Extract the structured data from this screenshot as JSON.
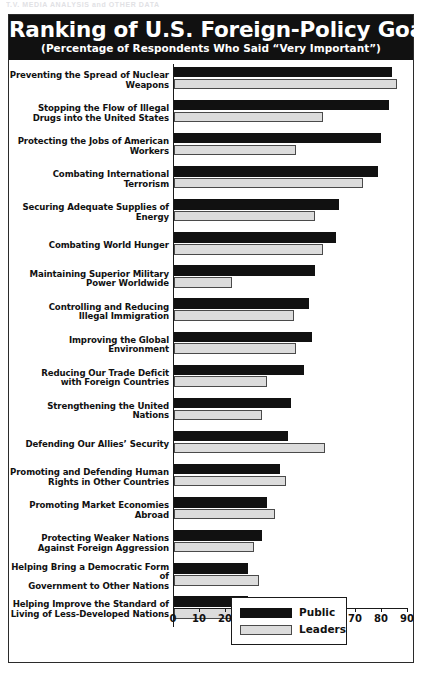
{
  "running_head": "T.V. MEDIA ANALYSIS and OTHER DATA",
  "chart_data": {
    "type": "bar",
    "orientation": "horizontal",
    "title": "Ranking of U.S. Foreign-Policy Goals",
    "subtitle": "(Percentage of Respondents Who Said “Very Important”)",
    "xlabel": "",
    "ylabel": "",
    "xlim": [
      0,
      90
    ],
    "grid": false,
    "legend_position": "bottom-right",
    "tick_labels": [
      "0",
      "10",
      "20",
      "30",
      "40",
      "50",
      "60",
      "70",
      "80",
      "90"
    ],
    "ticks": [
      0,
      10,
      20,
      30,
      40,
      50,
      60,
      70,
      80,
      90
    ],
    "categories": [
      "Preventing the Spread of Nuclear Weapons",
      "Stopping the Flow of Illegal\nDrugs into the United States",
      "Protecting the Jobs of American Workers",
      "Combating International Terrorism",
      "Securing Adequate Supplies of Energy",
      "Combating World Hunger",
      "Maintaining Superior Military\nPower Worldwide",
      "Controlling and Reducing\nIllegal Immigration",
      "Improving the Global Environment",
      "Reducing Our Trade Deficit\nwith Foreign Countries",
      "Strengthening the United Nations",
      "Defending Our Allies’ Security",
      "Promoting and Defending Human\nRights in Other Countries",
      "Promoting Market Economies Abroad",
      "Protecting Weaker Nations\nAgainst Foreign Aggression",
      "Helping Bring a Democratic Form of\nGovernment to Other Nations",
      "Helping Improve the Standard of\nLiving of Less-Developed Nations"
    ],
    "series": [
      {
        "name": "Public",
        "color": "#111111",
        "values": [
          82,
          81,
          78,
          77,
          62,
          61,
          53,
          51,
          52,
          49,
          44,
          43,
          40,
          35,
          33,
          28,
          28
        ]
      },
      {
        "name": "Leaders",
        "color": "#dcdcdc",
        "values": [
          84,
          56,
          46,
          71,
          53,
          56,
          22,
          45,
          46,
          35,
          33,
          57,
          42,
          38,
          30,
          32,
          38
        ]
      }
    ]
  },
  "legend": {
    "items": [
      {
        "label": "Public",
        "color": "#111111"
      },
      {
        "label": "Leaders",
        "color": "#dcdcdc"
      }
    ]
  }
}
